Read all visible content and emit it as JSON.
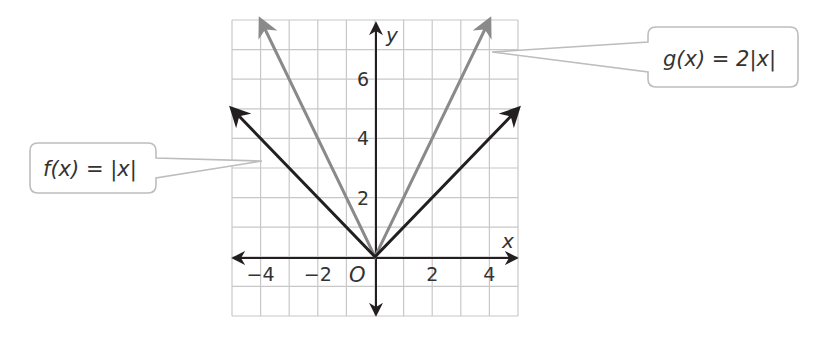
{
  "chart_data": {
    "type": "line",
    "title": "",
    "xlabel": "x",
    "ylabel": "y",
    "origin_label": "O",
    "xlim": [
      -5,
      5
    ],
    "ylim": [
      -2,
      8
    ],
    "grid": true,
    "x_ticks": [
      -4,
      -2,
      2,
      4
    ],
    "x_tick_labels": [
      "−4",
      "−2",
      "2",
      "4"
    ],
    "y_ticks": [
      2,
      4,
      6
    ],
    "y_tick_labels": [
      "2",
      "4",
      "6"
    ],
    "series": [
      {
        "name": "f(x) = |x|",
        "color": "#231f20",
        "x": [
          -5,
          0,
          5
        ],
        "values": [
          5,
          0,
          5
        ]
      },
      {
        "name": "g(x) = 2|x|",
        "color": "#8a8a8a",
        "x": [
          -4,
          0,
          4
        ],
        "values": [
          8,
          0,
          8
        ]
      }
    ],
    "annotations": [
      {
        "text": "f(x) = |x|",
        "points_to": "f",
        "position": "left"
      },
      {
        "text": "g(x) = 2|x|",
        "points_to": "g",
        "position": "top-right"
      }
    ]
  },
  "callouts": {
    "f_label": "f(x) = |x|",
    "g_label": "g(x) = 2|x|"
  },
  "colors": {
    "grid": "#c8c8c8",
    "axis": "#231f20",
    "f_line": "#231f20",
    "g_line": "#8a8a8a",
    "callout_border": "#bdbdbd"
  }
}
